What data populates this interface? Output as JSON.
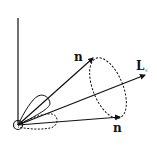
{
  "diagram": {
    "type": "vector-precession",
    "labels": {
      "n_upper": "n",
      "n_lower": "n",
      "L": "L",
      "L_subscript": "s"
    },
    "colors": {
      "stroke": "#111111",
      "background": "#ffffff"
    },
    "elements": [
      {
        "name": "vertical-axis",
        "style": "solid"
      },
      {
        "name": "origin-circle",
        "style": "solid"
      },
      {
        "name": "vector-n-upper",
        "style": "solid-arrow",
        "label": "n"
      },
      {
        "name": "vector-L",
        "style": "solid-arrow",
        "label": "L"
      },
      {
        "name": "vector-n-lower",
        "style": "solid-arrow",
        "label": "n"
      },
      {
        "name": "precession-cone-ellipse",
        "style": "dashed"
      },
      {
        "name": "small-lobe-upper",
        "style": "solid"
      },
      {
        "name": "small-lobe-lower",
        "style": "dashed"
      }
    ]
  }
}
